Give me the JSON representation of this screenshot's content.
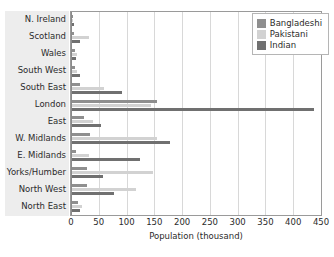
{
  "chart_data": {
    "type": "bar",
    "orientation": "horizontal",
    "title": "",
    "xlabel": "Population (thousand)",
    "ylabel": "",
    "xlim": [
      0,
      450
    ],
    "xticks": [
      0,
      50,
      100,
      150,
      200,
      250,
      300,
      350,
      400,
      450
    ],
    "grid": true,
    "legend_position": "top-right",
    "categories": [
      "N. Ireland",
      "Scotland",
      "Wales",
      "South West",
      "South East",
      "London",
      "East",
      "W. Midlands",
      "E. Midlands",
      "Yorks/Humber",
      "North West",
      "North East"
    ],
    "series": [
      {
        "name": "Bangladeshi",
        "color": "#8f8f8f",
        "values": [
          2,
          3,
          6,
          5,
          15,
          153,
          22,
          32,
          8,
          27,
          27,
          11
        ]
      },
      {
        "name": "Pakistani",
        "color": "#d2d2d2",
        "values": [
          2,
          30,
          9,
          9,
          58,
          143,
          37,
          153,
          30,
          145,
          115,
          18
        ]
      },
      {
        "name": "Indian",
        "color": "#707070",
        "values": [
          3,
          15,
          8,
          15,
          90,
          436,
          53,
          176,
          122,
          55,
          75,
          14
        ]
      }
    ]
  },
  "legend": {
    "items": [
      {
        "label": "Bangladeshi"
      },
      {
        "label": "Pakistani"
      },
      {
        "label": "Indian"
      }
    ]
  }
}
